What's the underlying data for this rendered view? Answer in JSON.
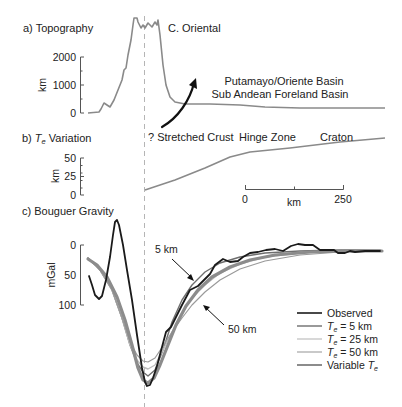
{
  "chart_data": [
    {
      "panel": "a",
      "type": "line",
      "title": "a) Topography",
      "ylabel": "km",
      "yticks": [
        0,
        1000,
        2000
      ],
      "ylim": [
        0,
        3000
      ],
      "annotations": [
        "C. Oriental",
        "Putamayo/Oriente Basin",
        "Sub Andean Foreland Basin"
      ],
      "series": [
        {
          "name": "Topography",
          "color": "#8a8a8a",
          "points": [
            [
              88,
              113
            ],
            [
              99,
              112
            ],
            [
              101,
              109
            ],
            [
              104,
              103
            ],
            [
              107,
              105
            ],
            [
              110,
              107
            ],
            [
              114,
              100
            ],
            [
              118,
              90
            ],
            [
              122,
              80
            ],
            [
              124,
              70
            ],
            [
              126,
              68
            ],
            [
              128,
              55
            ],
            [
              131,
              40
            ],
            [
              133,
              25
            ],
            [
              134,
              18
            ],
            [
              137,
              18
            ],
            [
              138,
              22
            ],
            [
              141,
              28
            ],
            [
              143,
              25
            ],
            [
              145,
              28
            ],
            [
              148,
              23
            ],
            [
              152,
              27
            ],
            [
              155,
              22
            ],
            [
              157,
              25
            ],
            [
              158,
              20
            ],
            [
              160,
              35
            ],
            [
              163,
              65
            ],
            [
              166,
              85
            ],
            [
              170,
              97
            ],
            [
              175,
              102
            ],
            [
              185,
              104
            ],
            [
              210,
              104
            ],
            [
              240,
              105
            ],
            [
              265,
              107
            ],
            [
              300,
              108
            ],
            [
              340,
              108
            ],
            [
              385,
              108
            ]
          ]
        }
      ]
    },
    {
      "panel": "b",
      "type": "line",
      "title": "b) Te Variation",
      "ylabel": "km",
      "yticks": [
        0,
        25,
        50
      ],
      "ylim": [
        0,
        50
      ],
      "annotations": [
        "? Stretched Crust",
        "Hinge Zone",
        "Craton"
      ],
      "scale_bar": {
        "start": "0",
        "end": "250",
        "unit": "km"
      },
      "series": [
        {
          "name": "Te",
          "color": "#8a8a8a",
          "points": [
            [
              145,
              190
            ],
            [
              175,
              180
            ],
            [
              205,
              168
            ],
            [
              230,
              157
            ],
            [
              250,
              152
            ],
            [
              290,
              148
            ],
            [
              340,
              142
            ],
            [
              385,
              138
            ]
          ]
        }
      ]
    },
    {
      "panel": "c",
      "type": "line",
      "title": "c) Bouguer Gravity",
      "ylabel": "mGal",
      "yticks": [
        0,
        50,
        100
      ],
      "ylim": [
        100,
        0
      ],
      "annotations": [
        "5 km",
        "50 km"
      ],
      "series": [
        {
          "name": "Observed",
          "color": "#1a1a1a",
          "width": 1.8,
          "points": [
            [
              89,
              276
            ],
            [
              92,
              285
            ],
            [
              95,
              295
            ],
            [
              99,
              299
            ],
            [
              102,
              296
            ],
            [
              106,
              280
            ],
            [
              110,
              257
            ],
            [
              113,
              235
            ],
            [
              115,
              222
            ],
            [
              117,
              220
            ],
            [
              119,
              225
            ],
            [
              123,
              245
            ],
            [
              127,
              270
            ],
            [
              132,
              300
            ],
            [
              137,
              335
            ],
            [
              142,
              368
            ],
            [
              145,
              382
            ],
            [
              147,
              386
            ],
            [
              150,
              385
            ],
            [
              153,
              378
            ],
            [
              157,
              366
            ],
            [
              162,
              347
            ],
            [
              166,
              332
            ],
            [
              171,
              327
            ],
            [
              176,
              317
            ],
            [
              182,
              305
            ],
            [
              190,
              290
            ],
            [
              198,
              286
            ],
            [
              204,
              280
            ],
            [
              210,
              274
            ],
            [
              215,
              265
            ],
            [
              223,
              259
            ],
            [
              230,
              262
            ],
            [
              238,
              261
            ],
            [
              243,
              257
            ],
            [
              250,
              253
            ],
            [
              258,
              252
            ],
            [
              266,
              250
            ],
            [
              275,
              249
            ],
            [
              283,
              251
            ],
            [
              291,
              246
            ],
            [
              298,
              244
            ],
            [
              305,
              245
            ],
            [
              313,
              245
            ],
            [
              320,
              250
            ],
            [
              327,
              250
            ],
            [
              334,
              250
            ],
            [
              338,
              253
            ],
            [
              345,
              253
            ],
            [
              350,
              251
            ],
            [
              355,
              252
            ],
            [
              365,
              251
            ],
            [
              380,
              251
            ]
          ]
        },
        {
          "name": "Te = 5 km",
          "color": "#6e6e6e",
          "width": 1.4,
          "points": [
            [
              88,
              258
            ],
            [
              100,
              270
            ],
            [
              112,
              290
            ],
            [
              122,
              318
            ],
            [
              130,
              345
            ],
            [
              137,
              363
            ],
            [
              143,
              372
            ],
            [
              148,
              376
            ],
            [
              155,
              370
            ],
            [
              163,
              350
            ],
            [
              172,
              322
            ],
            [
              182,
              300
            ],
            [
              192,
              285
            ],
            [
              205,
              272
            ],
            [
              220,
              263
            ],
            [
              240,
              257
            ],
            [
              265,
              253
            ],
            [
              300,
              251
            ],
            [
              340,
              250
            ],
            [
              380,
              250
            ]
          ]
        },
        {
          "name": "Te = 25 km",
          "color": "#bdbdbd",
          "width": 1.4,
          "points": [
            [
              88,
              258
            ],
            [
              100,
              270
            ],
            [
              112,
              290
            ],
            [
              122,
              318
            ],
            [
              130,
              345
            ],
            [
              137,
              360
            ],
            [
              143,
              367
            ],
            [
              148,
              369
            ],
            [
              155,
              365
            ],
            [
              163,
              350
            ],
            [
              172,
              332
            ],
            [
              182,
              313
            ],
            [
              192,
              298
            ],
            [
              205,
              285
            ],
            [
              220,
              273
            ],
            [
              240,
              264
            ],
            [
              265,
              257
            ],
            [
              300,
              253
            ],
            [
              340,
              251
            ],
            [
              380,
              250
            ]
          ]
        },
        {
          "name": "Te = 50 km",
          "color": "#9a9a9a",
          "width": 1.2,
          "points": [
            [
              88,
              258
            ],
            [
              100,
              270
            ],
            [
              112,
              290
            ],
            [
              122,
              318
            ],
            [
              130,
              342
            ],
            [
              137,
              355
            ],
            [
              143,
              361
            ],
            [
              148,
              362
            ],
            [
              155,
              358
            ],
            [
              163,
              346
            ],
            [
              172,
              332
            ],
            [
              182,
              318
            ],
            [
              192,
              305
            ],
            [
              205,
              292
            ],
            [
              220,
              280
            ],
            [
              240,
              269
            ],
            [
              265,
              261
            ],
            [
              300,
              255
            ],
            [
              340,
              252
            ],
            [
              380,
              251
            ]
          ]
        },
        {
          "name": "Variable Te",
          "color": "#8c8c8c",
          "width": 3.2,
          "points": [
            [
              88,
              259
            ],
            [
              97,
              265
            ],
            [
              107,
              277
            ],
            [
              117,
              297
            ],
            [
              125,
              320
            ],
            [
              132,
              345
            ],
            [
              138,
              368
            ],
            [
              143,
              380
            ],
            [
              148,
              383
            ],
            [
              154,
              378
            ],
            [
              160,
              365
            ],
            [
              168,
              345
            ],
            [
              176,
              325
            ],
            [
              186,
              306
            ],
            [
              198,
              290
            ],
            [
              212,
              277
            ],
            [
              230,
              267
            ],
            [
              250,
              260
            ],
            [
              275,
              255
            ],
            [
              310,
              252
            ],
            [
              345,
              251
            ],
            [
              382,
              251
            ]
          ]
        }
      ],
      "legend": {
        "position": "lower right",
        "entries": [
          "Observed",
          "Te = 5 km",
          "Te = 25 km",
          "Te = 50 km",
          "Variable Te"
        ]
      }
    }
  ],
  "labels": {
    "a_title": "a) Topography",
    "b_title_prefix": "b) ",
    "b_title_T": "T",
    "b_title_sub": "e",
    "b_title_suffix": " Variation",
    "c_title": "c) Bouguer Gravity",
    "a_ylabel": "km",
    "b_ylabel": "km",
    "c_ylabel": "mGal",
    "a_ticks": [
      "2000",
      "1000",
      "0"
    ],
    "b_ticks": [
      "50",
      "25",
      "0"
    ],
    "c_ticks": [
      "0",
      "50",
      "100"
    ],
    "c_oriental": "C. Oriental",
    "basin_line1": "Putamayo/Oriente Basin",
    "basin_line2": "Sub Andean Foreland Basin",
    "stretched": "? Stretched Crust",
    "hinge": "Hinge Zone",
    "craton": "Craton",
    "scale_0": "0",
    "scale_unit": "km",
    "scale_250": "250",
    "ann_5km": "5 km",
    "ann_50km": "50 km",
    "legend_observed": "Observed",
    "legend_te_prefix": "T",
    "legend_te_sub": "e",
    "legend_te5_suffix": " = 5 km",
    "legend_te25_suffix": " = 25 km",
    "legend_te50_suffix": " = 50 km",
    "legend_variable_prefix": "Variable ",
    "legend_variable_T": "T",
    "legend_variable_sub": "e"
  }
}
